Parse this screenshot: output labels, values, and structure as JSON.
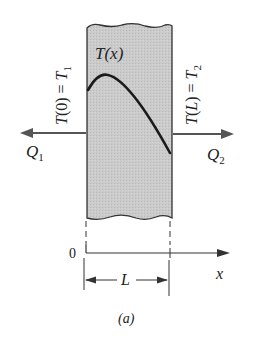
{
  "figure": {
    "caption": "(a)",
    "slab": {
      "fill": "#c9c9c9",
      "stroke": "#333333",
      "curve_label": "T(x)"
    },
    "left_boundary": {
      "T_var": "T",
      "T_arg": "(0)",
      "eq": " = ",
      "T_rhs": "T",
      "T_rhs_sub": "1",
      "heat_label": "Q",
      "heat_sub": "1",
      "arrow_direction": "left"
    },
    "right_boundary": {
      "T_var": "T",
      "T_arg": "(L)",
      "eq": " = ",
      "T_rhs": "T",
      "T_rhs_sub": "2",
      "heat_label": "Q",
      "heat_sub": "2",
      "arrow_direction": "right"
    },
    "axis": {
      "origin_label": "0",
      "axis_label": "x",
      "length_label": "L"
    }
  }
}
